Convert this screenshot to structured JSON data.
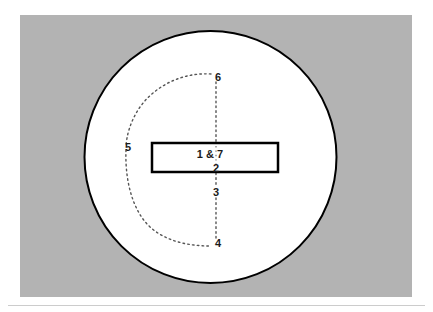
{
  "figure": {
    "title": "",
    "panel": {
      "background_color": "#b3b3b3",
      "x": 20,
      "y": 15,
      "width": 392,
      "height": 282
    },
    "baseline_rule": {
      "color": "#cccccc",
      "y": 305
    },
    "circle": {
      "name": "outer-circle",
      "fill_color": "#ffffff",
      "stroke_color": "#000000",
      "stroke_width": 2,
      "cx": 210.5,
      "cy": 157,
      "r": 126
    },
    "rectangle": {
      "name": "center-rectangle",
      "fill_color": "#ffffff",
      "stroke_color": "#000000",
      "stroke_width": 2.5,
      "x": 152,
      "y": 143,
      "width": 126,
      "height": 29
    },
    "path": {
      "name": "dotted-trajectory",
      "stroke_color": "#555555",
      "stroke_width": 1.4,
      "dash": "1.6 3.2"
    },
    "labels": {
      "inside_box_top": "1 & 7",
      "inside_box_bottom": "2",
      "waypoint_3": "3",
      "waypoint_4": "4",
      "waypoint_5": "5",
      "waypoint_6": "6",
      "color": "#1a1a1a"
    },
    "waypoints": [
      {
        "id": "1",
        "label": "1 & 7",
        "x": 206,
        "y": 156
      },
      {
        "id": "2",
        "label": "2",
        "x": 216,
        "y": 167
      },
      {
        "id": "3",
        "label": "3",
        "x": 216,
        "y": 192
      },
      {
        "id": "4",
        "label": "4",
        "x": 217,
        "y": 243
      },
      {
        "id": "5",
        "label": "5",
        "x": 128,
        "y": 147
      },
      {
        "id": "6",
        "label": "6",
        "x": 217,
        "y": 77
      },
      {
        "id": "7",
        "label": "7",
        "x": 232,
        "y": 156
      }
    ]
  }
}
